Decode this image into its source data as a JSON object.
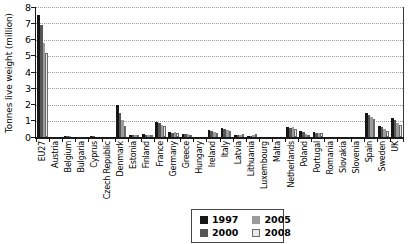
{
  "chart_data": {
    "type": "bar",
    "title": "",
    "ylabel": "Tonnes live weight (million)",
    "ylim": [
      0,
      8
    ],
    "ytick_step": 1,
    "grid": "horizontal-dotted",
    "legend_position": "bottom-center-box",
    "categories": [
      "EU27",
      "Austria",
      "Belgium",
      "Bulgaria",
      "Cyprus",
      "Czech Republic",
      "Denmark",
      "Estonia",
      "Finland",
      "France",
      "Germany",
      "Greece",
      "Hungary",
      "Ireland",
      "Italy",
      "Latvia",
      "Lithuania",
      "Luxembourg",
      "Malta",
      "Netherlands",
      "Poland",
      "Portugal",
      "Romania",
      "Slovakia",
      "Slovenia",
      "Spain",
      "Sweden",
      "UK"
    ],
    "series": [
      {
        "name": "1997",
        "color": "#161616",
        "border": "",
        "values": [
          7.5,
          0.02,
          0.05,
          0.02,
          0.04,
          0.02,
          1.95,
          0.14,
          0.18,
          0.9,
          0.3,
          0.2,
          0.02,
          0.45,
          0.55,
          0.1,
          0.06,
          0.0,
          0.01,
          0.6,
          0.4,
          0.28,
          0.01,
          0.01,
          0.01,
          1.5,
          0.7,
          1.15
        ]
      },
      {
        "name": "2000",
        "color": "#565656",
        "border": "",
        "values": [
          6.9,
          0.02,
          0.05,
          0.01,
          0.07,
          0.02,
          1.5,
          0.12,
          0.15,
          0.85,
          0.25,
          0.2,
          0.02,
          0.4,
          0.5,
          0.14,
          0.08,
          0.0,
          0.01,
          0.55,
          0.3,
          0.25,
          0.01,
          0.01,
          0.01,
          1.35,
          0.6,
          1.05
        ]
      },
      {
        "name": "2005",
        "color": "#9b9b9b",
        "border": "",
        "values": [
          5.8,
          0.02,
          0.04,
          0.01,
          0.03,
          0.02,
          1.05,
          0.1,
          0.13,
          0.75,
          0.3,
          0.18,
          0.02,
          0.3,
          0.45,
          0.15,
          0.1,
          0.0,
          0.01,
          0.6,
          0.2,
          0.22,
          0.01,
          0.01,
          0.01,
          1.25,
          0.5,
          0.85
        ]
      },
      {
        "name": "2008",
        "color": "#eaeaea",
        "border": "#6a6a6a",
        "values": [
          5.2,
          0.02,
          0.03,
          0.01,
          0.02,
          0.02,
          0.7,
          0.1,
          0.12,
          0.65,
          0.25,
          0.15,
          0.02,
          0.25,
          0.35,
          0.16,
          0.16,
          0.0,
          0.01,
          0.5,
          0.15,
          0.25,
          0.01,
          0.01,
          0.01,
          1.1,
          0.4,
          0.75
        ]
      }
    ]
  },
  "layout_colors": {
    "axis": "#1a1a1a",
    "gridline": "#9a9a9a",
    "background": "#ffffff"
  }
}
